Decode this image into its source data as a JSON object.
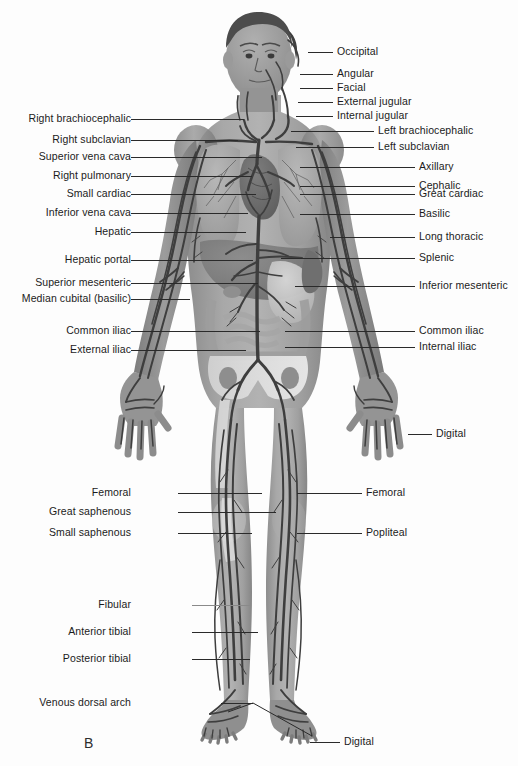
{
  "figure": {
    "letter": "B",
    "letter_pos": {
      "x": 84,
      "y": 735
    },
    "background": "#fdfdfd",
    "ink": "#1b1b1b",
    "body_fill": "#9a9a9a",
    "vein_color": "#4a4a4a",
    "skin_shadow": "#808080"
  },
  "labels_left": [
    {
      "text": "Right brachiocephalic",
      "y": 119,
      "line_x1": 131,
      "line_x2": 244
    },
    {
      "text": "Right subclavian",
      "y": 140,
      "line_x1": 131,
      "line_x2": 238
    },
    {
      "text": "Superior vena cava",
      "y": 157,
      "line_x1": 131,
      "line_x2": 262
    },
    {
      "text": "Right pulmonary",
      "y": 176,
      "line_x1": 131,
      "line_x2": 252
    },
    {
      "text": "Small cardiac",
      "y": 194,
      "line_x1": 131,
      "line_x2": 256
    },
    {
      "text": "Inferior vena cava",
      "y": 213,
      "line_x1": 131,
      "line_x2": 248
    },
    {
      "text": "Hepatic",
      "y": 232,
      "line_x1": 131,
      "line_x2": 246
    },
    {
      "text": "Hepatic portal",
      "y": 260,
      "line_x1": 131,
      "line_x2": 253
    },
    {
      "text": "Superior mesenteric",
      "y": 283,
      "line_x1": 131,
      "line_x2": 258
    },
    {
      "text": "Median cubital (basilic)",
      "y": 299,
      "line_x1": 131,
      "line_x2": 190
    },
    {
      "text": "Common iliac",
      "y": 331,
      "line_x1": 131,
      "line_x2": 260
    },
    {
      "text": "External iliac",
      "y": 350,
      "line_x1": 131,
      "line_x2": 246
    },
    {
      "text": "Femoral",
      "y": 493,
      "line_x1": 178,
      "line_x2": 262
    },
    {
      "text": "Great saphenous",
      "y": 512,
      "line_x1": 178,
      "line_x2": 276
    },
    {
      "text": "Small saphenous",
      "y": 533,
      "line_x1": 178,
      "line_x2": 252
    },
    {
      "text": "Fibular",
      "y": 605,
      "line_x1": 192,
      "line_x2": 250
    },
    {
      "text": "Anterior tibial",
      "y": 632,
      "line_x1": 192,
      "line_x2": 258
    },
    {
      "text": "Posterior tibial",
      "y": 659,
      "line_x1": 192,
      "line_x2": 250
    },
    {
      "text": "Venous dorsal arch",
      "y": 703,
      "line_x1": 221,
      "line_x2": 253
    }
  ],
  "labels_right": [
    {
      "text": "Occipital",
      "y": 52,
      "line_x1": 308,
      "line_x2": 333
    },
    {
      "text": "Angular",
      "y": 74,
      "line_x1": 300,
      "line_x2": 333
    },
    {
      "text": "Facial",
      "y": 88,
      "line_x1": 300,
      "line_x2": 333
    },
    {
      "text": "External jugular",
      "y": 102,
      "line_x1": 298,
      "line_x2": 333
    },
    {
      "text": "Internal jugular",
      "y": 116,
      "line_x1": 296,
      "line_x2": 333
    },
    {
      "text": "Left brachiocephalic",
      "y": 131,
      "line_x1": 291,
      "line_x2": 374
    },
    {
      "text": "Left subclavian",
      "y": 147,
      "line_x1": 296,
      "line_x2": 374
    },
    {
      "text": "Axillary",
      "y": 167,
      "line_x1": 300,
      "line_x2": 415
    },
    {
      "text": "Cephalic",
      "y": 186,
      "line_x1": 300,
      "line_x2": 415
    },
    {
      "text": "Great cardiac",
      "y": 194,
      "line_x1": 300,
      "line_x2": 415
    },
    {
      "text": "Basilic",
      "y": 214,
      "line_x1": 300,
      "line_x2": 415
    },
    {
      "text": "Long thoracic",
      "y": 237,
      "line_x1": 330,
      "line_x2": 415
    },
    {
      "text": "Splenic",
      "y": 258,
      "line_x1": 281,
      "line_x2": 415
    },
    {
      "text": "Inferior mesenteric",
      "y": 286,
      "line_x1": 295,
      "line_x2": 415
    },
    {
      "text": "Common iliac",
      "y": 331,
      "line_x1": 285,
      "line_x2": 415
    },
    {
      "text": "Internal iliac",
      "y": 347,
      "line_x1": 285,
      "line_x2": 415
    },
    {
      "text": "Digital",
      "y": 434,
      "line_x1": 408,
      "line_x2": 432
    },
    {
      "text": "Femoral",
      "y": 493,
      "line_x1": 297,
      "line_x2": 362
    },
    {
      "text": "Popliteal",
      "y": 533,
      "line_x1": 297,
      "line_x2": 362
    },
    {
      "text": "Digital",
      "y": 742,
      "line_x1": 310,
      "line_x2": 340
    }
  ],
  "anatomy": {
    "organs": [
      "right lung",
      "left lung",
      "heart",
      "liver",
      "stomach",
      "spleen",
      "small intestine",
      "large intestine",
      "pelvis"
    ],
    "vessel_system": "systemic venous system",
    "view": "anterior full-body"
  }
}
